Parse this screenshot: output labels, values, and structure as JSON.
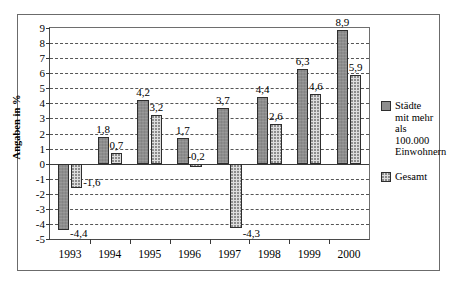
{
  "chart_data": {
    "type": "bar",
    "title": "",
    "xlabel": "",
    "ylabel": "Angaben in %",
    "ylim": [
      -5,
      9
    ],
    "ytick_step": 1,
    "yticks": [
      "9",
      "8",
      "7",
      "6",
      "5",
      "4",
      "3",
      "2",
      "1",
      "0",
      "-1",
      "-2",
      "-3",
      "-4",
      "-5"
    ],
    "grid": true,
    "grid_style": "dashed-horizontal",
    "legend_position": "right",
    "decimal_separator": ",",
    "categories": [
      "1993",
      "1994",
      "1995",
      "1996",
      "1997",
      "1998",
      "1999",
      "2000"
    ],
    "series": [
      {
        "name": "Städte mit mehr als 100.000 Einwohnern",
        "color": "#8d8d8d",
        "values": [
          -4.4,
          1.8,
          4.2,
          1.7,
          3.7,
          4.4,
          6.3,
          8.9
        ],
        "labels": [
          "-4,4",
          "1,8",
          "4,2",
          "1,7",
          "3,7",
          "4,4",
          "6,3",
          "8,9"
        ]
      },
      {
        "name": "Gesamt",
        "color": "#dedede",
        "values": [
          -1.6,
          0.7,
          3.2,
          -0.2,
          -4.3,
          2.6,
          4.6,
          5.9
        ],
        "labels": [
          "-1,6",
          "0,7",
          "3,2",
          "-0,2",
          "-4,3",
          "2,6",
          "4,6",
          "5,9"
        ]
      }
    ]
  },
  "legend": {
    "entries": [
      {
        "label_lines": [
          "Städte",
          "mit mehr",
          "als 100.000",
          "Einwohnern"
        ],
        "swatch": "series-0"
      },
      {
        "label_lines": [
          "Gesamt"
        ],
        "swatch": "series-1"
      }
    ]
  }
}
